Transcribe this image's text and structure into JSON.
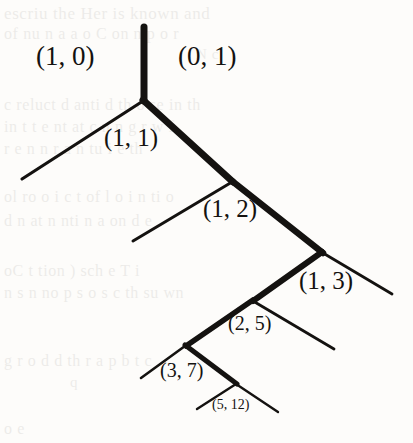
{
  "figure": {
    "background_color": "#fdfcfa",
    "ink_color": "#141210"
  },
  "tree": {
    "labels": [
      {
        "id": "label-1-0",
        "text": "(1, 0)",
        "x": 36,
        "y": 43,
        "size": "lg"
      },
      {
        "id": "label-0-1",
        "text": "(0, 1)",
        "x": 178,
        "y": 43,
        "size": "lg"
      },
      {
        "id": "label-1-1",
        "text": "(1, 1)",
        "x": 104,
        "y": 125,
        "size": "md"
      },
      {
        "id": "label-1-2",
        "text": "(1, 2)",
        "x": 203,
        "y": 196,
        "size": "md"
      },
      {
        "id": "label-1-3",
        "text": "(1, 3)",
        "x": 299,
        "y": 268,
        "size": "md"
      },
      {
        "id": "label-2-5",
        "text": "(2, 5)",
        "x": 228,
        "y": 313,
        "size": "sm"
      },
      {
        "id": "label-3-7",
        "text": "(3, 7)",
        "x": 160,
        "y": 360,
        "size": "sm"
      },
      {
        "id": "label-5-12",
        "text": "(5, 12)",
        "x": 212,
        "y": 398,
        "size": "xs"
      }
    ],
    "edges_thick": [
      {
        "id": "trunk",
        "x1": 144,
        "y1": 27,
        "x2": 144,
        "y2": 101,
        "w": 7
      },
      {
        "id": "edge-right-1",
        "x1": 143,
        "y1": 100,
        "x2": 233,
        "y2": 182,
        "w": 7
      },
      {
        "id": "edge-right-2",
        "x1": 232,
        "y1": 181,
        "x2": 323,
        "y2": 253,
        "w": 6.5
      },
      {
        "id": "edge-left-3",
        "x1": 322,
        "y1": 252,
        "x2": 253,
        "y2": 301,
        "w": 6
      },
      {
        "id": "edge-left-4",
        "x1": 253,
        "y1": 300,
        "x2": 186,
        "y2": 346,
        "w": 5.5
      },
      {
        "id": "edge-right-5",
        "x1": 185,
        "y1": 345,
        "x2": 237,
        "y2": 384,
        "w": 5
      }
    ],
    "edges_thin": [
      {
        "id": "edge-left-1",
        "x1": 143,
        "y1": 101,
        "x2": 22,
        "y2": 179,
        "w": 3.2
      },
      {
        "id": "edge-left-2",
        "x1": 232,
        "y1": 182,
        "x2": 133,
        "y2": 241,
        "w": 3.0
      },
      {
        "id": "edge-right-3",
        "x1": 323,
        "y1": 253,
        "x2": 392,
        "y2": 294,
        "w": 2.8
      },
      {
        "id": "edge-right-4",
        "x1": 253,
        "y1": 301,
        "x2": 334,
        "y2": 349,
        "w": 2.8
      },
      {
        "id": "edge-left-5",
        "x1": 185,
        "y1": 346,
        "x2": 141,
        "y2": 378,
        "w": 2.6
      },
      {
        "id": "edge-left-6",
        "x1": 236,
        "y1": 384,
        "x2": 197,
        "y2": 409,
        "w": 2.4
      },
      {
        "id": "edge-right-6",
        "x1": 236,
        "y1": 384,
        "x2": 278,
        "y2": 412,
        "w": 2.4
      }
    ]
  },
  "background_text": {
    "note": "faint show-through of printing on the reverse side of the page",
    "lines": [
      {
        "id": "ghost-1",
        "text": "escriu          the Her is known and",
        "x": 4,
        "y": 4,
        "size": 17
      },
      {
        "id": "ghost-2",
        "text": "of nu n   a          a  o  C on     n  p o r",
        "x": 4,
        "y": 25,
        "size": 16
      },
      {
        "id": "ghost-3",
        "text": "N c",
        "x": 196,
        "y": 46,
        "size": 15
      },
      {
        "id": "ghost-4",
        "text": "c  reluct d  anti   d th   o  se   in  th",
        "x": 4,
        "y": 96,
        "size": 16
      },
      {
        "id": "ghost-5",
        "text": "in  t  t e     nt  at    c n n  g  r   w  f",
        "x": 4,
        "y": 118,
        "size": 16
      },
      {
        "id": "ghost-6",
        "text": "r  e n      n   r   a    n   tu   i   e  th",
        "x": 4,
        "y": 140,
        "size": 16
      },
      {
        "id": "ghost-7",
        "text": "ol    ro o  i      c  t of  l  o i  n ti  o",
        "x": 4,
        "y": 188,
        "size": 16
      },
      {
        "id": "ghost-8",
        "text": "d      n     at  n  nti  n  a  on   d  e",
        "x": 4,
        "y": 212,
        "size": 16
      },
      {
        "id": "ghost-9",
        "text": "oC         t        tion ) sch e   T i",
        "x": 4,
        "y": 262,
        "size": 16
      },
      {
        "id": "ghost-10",
        "text": "n s n    no    p    s o    s  c  th   su   wn",
        "x": 4,
        "y": 284,
        "size": 16
      },
      {
        "id": "ghost-11",
        "text": "g  r  o  d d  th  r   a    p    b  t  c",
        "x": 4,
        "y": 352,
        "size": 16
      },
      {
        "id": "ghost-12",
        "text": "q",
        "x": 70,
        "y": 374,
        "size": 15
      },
      {
        "id": "ghost-13",
        "text": "o   e",
        "x": 4,
        "y": 420,
        "size": 16
      }
    ]
  }
}
